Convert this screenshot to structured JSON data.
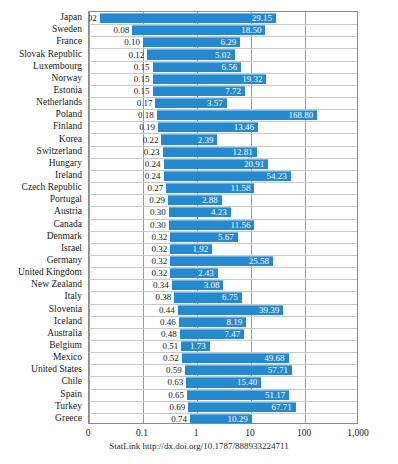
{
  "chart_data": {
    "type": "bar",
    "orientation": "horizontal",
    "title": "",
    "subtitle": "",
    "xlabel": "",
    "ylabel": "",
    "scale": "log",
    "grid": true,
    "legend": false,
    "xticks": [
      "0",
      "0.1",
      "1",
      "10",
      "100",
      "1,000"
    ],
    "xtick_values": [
      0,
      0.1,
      1,
      10,
      100,
      1000
    ],
    "xlim": [
      0,
      1000
    ],
    "categories": [
      "Japan",
      "Sweden",
      "France",
      "Slovak Republic",
      "Luxembourg",
      "Norway",
      "Estonia",
      "Netherlands",
      "Poland",
      "Finland",
      "Korea",
      "Switzerland",
      "Hungary",
      "Ireland",
      "Czech Republic",
      "Portugal",
      "Austria",
      "Canada",
      "Denmark",
      "Israel",
      "Germany",
      "United Kingdom",
      "New Zealand",
      "Italy",
      "Slovenia",
      "Iceland",
      "Australia",
      "Belgium",
      "Mexico",
      "United States",
      "Chile",
      "Spain",
      "Turkey",
      "Greece"
    ],
    "series": [
      {
        "name": "low",
        "values": [
          0.02,
          0.08,
          0.1,
          0.12,
          0.15,
          0.15,
          0.15,
          0.17,
          0.18,
          0.19,
          0.22,
          0.23,
          0.24,
          0.24,
          0.27,
          0.29,
          0.3,
          0.3,
          0.32,
          0.32,
          0.32,
          0.32,
          0.34,
          0.38,
          0.44,
          0.46,
          0.48,
          0.51,
          0.52,
          0.59,
          0.63,
          0.65,
          0.69,
          0.74
        ],
        "labels": [
          "0.02",
          "0.08",
          "0.10",
          "0.12",
          "0.15",
          "0.15",
          "0.15",
          "0.17",
          "0.18",
          "0.19",
          "0.22",
          "0.23",
          "0.24",
          "0.24",
          "0.27",
          "0.29",
          "0.30",
          "0.30",
          "0.32",
          "0.32",
          "0.32",
          "0.32",
          "0.34",
          "0.38",
          "0.44",
          "0.46",
          "0.48",
          "0.51",
          "0.52",
          "0.59",
          "0.63",
          "0.65",
          "0.69",
          "0.74"
        ]
      },
      {
        "name": "high",
        "values": [
          29.15,
          18.5,
          6.29,
          5.02,
          6.56,
          19.32,
          7.72,
          3.57,
          168.8,
          13.46,
          2.39,
          12.81,
          20.91,
          54.23,
          11.58,
          2.88,
          4.23,
          11.56,
          5.67,
          1.92,
          25.58,
          2.43,
          3.08,
          6.75,
          39.39,
          8.19,
          7.47,
          1.73,
          49.68,
          57.71,
          15.4,
          51.17,
          67.71,
          10.29
        ],
        "labels": [
          "29.15",
          "18.50",
          "6.29",
          "5.02",
          "6.56",
          "19.32",
          "7.72",
          "3.57",
          "168.80",
          "13.46",
          "2.39",
          "12.81",
          "20.91",
          "54.23",
          "11.58",
          "2.88",
          "4.23",
          "11.56",
          "5.67",
          "1.92",
          "25.58",
          "2.43",
          "3.08",
          "6.75",
          "39.39",
          "8.19",
          "7.47",
          "1.73",
          "49.68",
          "57.71",
          "15.40",
          "51.17",
          "67.71",
          "10.29"
        ]
      }
    ],
    "bar_color": "#2589d0",
    "grid_color": "#9a9a9a",
    "frame_color": "#8a8a8a"
  },
  "footer": {
    "statlink": "StatLink http://dx.doi.org/10.1787/888933224711"
  }
}
